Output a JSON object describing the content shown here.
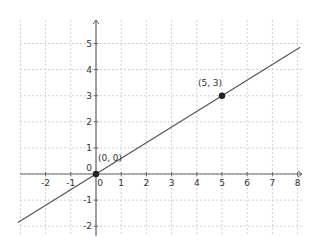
{
  "chart_data": {
    "type": "line",
    "title": "",
    "xlabel": "",
    "ylabel": "",
    "xlim": [
      -3.1,
      8.3
    ],
    "ylim": [
      -2.3,
      5.8
    ],
    "grid": true,
    "x_ticks": [
      -2,
      -1,
      0,
      1,
      2,
      3,
      4,
      5,
      6,
      7,
      8
    ],
    "y_ticks": [
      -2,
      -1,
      0,
      1,
      2,
      3,
      4,
      5
    ],
    "series": [
      {
        "name": "line through origin",
        "equation": "y = 0.6x",
        "x": [
          -3.1,
          8.1
        ],
        "y": [
          -1.86,
          4.86
        ],
        "color": "#555555"
      }
    ],
    "points": [
      {
        "label": "(0, 0)",
        "x": 0,
        "y": 0
      },
      {
        "label": "(5, 3)",
        "x": 5,
        "y": 3
      }
    ],
    "origin_label": "0",
    "colors": {
      "axis": "#666666",
      "grid": "#d0d0d0",
      "line": "#555555",
      "point": "#222222"
    }
  }
}
